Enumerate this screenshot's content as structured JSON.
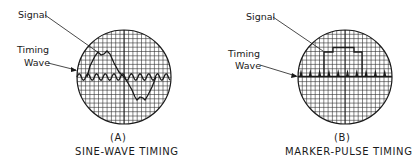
{
  "figure": {
    "panels": [
      {
        "id": "A",
        "letter": "(A)",
        "caption": "SINE-WAVE TIMING",
        "signal_label": "Signal",
        "timing_label_line1": "Timing",
        "timing_label_line2": "Wave",
        "timing_type": "sine-wave",
        "signal_shape": "sine with notched peaks"
      },
      {
        "id": "B",
        "letter": "(B)",
        "caption": "MARKER-PULSE TIMING",
        "signal_label": "Signal",
        "timing_label_line1": "Timing",
        "timing_label_line2": "Wave",
        "timing_type": "marker-pulse",
        "signal_shape": "stepped rectangular pulse"
      }
    ],
    "colors": {
      "ink": "#1a1a1a",
      "background": "#ffffff",
      "grid": "#333333"
    }
  }
}
